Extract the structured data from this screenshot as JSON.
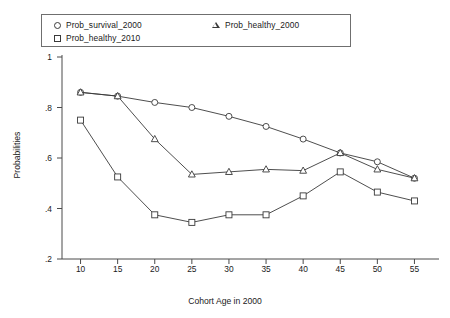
{
  "chart_data": {
    "type": "line",
    "title": "",
    "xlabel": "Cohort Age in 2000",
    "ylabel": "Probabilities",
    "x": [
      10,
      15,
      20,
      25,
      30,
      35,
      40,
      45,
      50,
      55
    ],
    "xlim": [
      7.5,
      57.5
    ],
    "ylim": [
      0.2,
      1.0
    ],
    "xticks": [
      "10",
      "15",
      "20",
      "25",
      "30",
      "35",
      "40",
      "45",
      "50",
      "55"
    ],
    "yticks": [
      "1",
      ".8",
      ".6",
      ".4",
      ".2"
    ],
    "ytick_values": [
      1,
      0.8,
      0.6,
      0.4,
      0.2
    ],
    "grid": false,
    "legend_position": "top",
    "series": [
      {
        "name": "Prob_survival_2000",
        "marker": "circle",
        "color": "#3a3a3a",
        "values": [
          0.86,
          0.845,
          0.82,
          0.8,
          0.765,
          0.725,
          0.675,
          0.62,
          0.585,
          0.52
        ]
      },
      {
        "name": "Prob_healthy_2010",
        "marker": "square",
        "color": "#3a3a3a",
        "values": [
          0.75,
          0.525,
          0.375,
          0.345,
          0.375,
          0.375,
          0.45,
          0.545,
          0.465,
          0.43
        ]
      },
      {
        "name": "Prob_healthy_2000",
        "marker": "triangle",
        "color": "#3a3a3a",
        "values": [
          0.86,
          0.845,
          0.675,
          0.535,
          0.545,
          0.555,
          0.55,
          0.62,
          0.555,
          0.52
        ]
      }
    ]
  },
  "legend": {
    "entries": [
      {
        "label": "Prob_survival_2000",
        "marker": "circle-marker-icon"
      },
      {
        "label": "Prob_healthy_2010",
        "marker": "square-marker-icon"
      },
      {
        "label": "Prob_healthy_2000",
        "marker": "triangle-marker-icon"
      }
    ]
  },
  "colors": {
    "line": "#3a3a3a",
    "axis": "#4a4a4a",
    "background": "#ffffff",
    "legend_border": "#6f6f6f"
  }
}
